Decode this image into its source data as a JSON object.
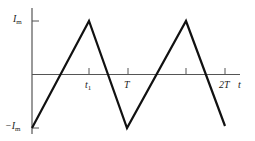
{
  "diagram": {
    "type": "triangular-waveform",
    "colors": {
      "axis": "#555555",
      "waveform": "#111111",
      "label": "#222222",
      "background": "#ffffff"
    },
    "axes": {
      "y_max_label": {
        "main": "I",
        "sub": "m"
      },
      "y_min_label": {
        "prefix": "−",
        "main": "I",
        "sub": "m"
      },
      "x_axis_label": "t",
      "x_ticks": [
        {
          "label_main": "t",
          "label_sub": "1"
        },
        {
          "label_main": "T",
          "label_sub": ""
        },
        {
          "label_main": "",
          "label_sub": ""
        },
        {
          "label_main": "2T",
          "label_sub": ""
        }
      ]
    },
    "waveform_points": [
      {
        "t": "0",
        "value": "-Im"
      },
      {
        "t": "t1",
        "value": "Im"
      },
      {
        "t": "T",
        "value": "-Im"
      },
      {
        "t": "T+t1",
        "value": "Im"
      },
      {
        "t": "2T",
        "value": "-Im"
      }
    ]
  }
}
